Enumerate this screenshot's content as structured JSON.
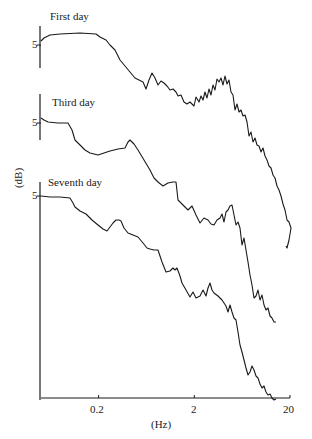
{
  "chart_data": {
    "type": "line",
    "title": "",
    "xlabel": "(Hz)",
    "ylabel": "(dB)",
    "xscale": "log",
    "xlim": [
      0.05,
      20
    ],
    "x_ticks": [
      {
        "value": 0.2,
        "label": "0.2"
      },
      {
        "value": 2,
        "label": "2"
      },
      {
        "value": 20,
        "label": "20"
      }
    ],
    "y_tick_label": "5",
    "grid": false,
    "legend_position": "none (inline labels above each trace)",
    "layout": "three vertically offset spectra sharing a log-frequency axis; each trace has its own short y-axis segment with a '5' dB tick",
    "series": [
      {
        "name": "First day",
        "offset_axis": {
          "x": 40,
          "y_top": 26,
          "y_bottom": 68,
          "tick_y": 45
        },
        "label_pos": {
          "x": 50,
          "y": 20
        },
        "points_px": [
          [
            41,
            41
          ],
          [
            44,
            38
          ],
          [
            50,
            35
          ],
          [
            60,
            34
          ],
          [
            80,
            33
          ],
          [
            96,
            34
          ],
          [
            100,
            37
          ],
          [
            106,
            40
          ],
          [
            110,
            45
          ],
          [
            115,
            50
          ],
          [
            120,
            60
          ],
          [
            125,
            66
          ],
          [
            130,
            72
          ],
          [
            135,
            78
          ],
          [
            139,
            80
          ],
          [
            143,
            82
          ],
          [
            146,
            89
          ],
          [
            149,
            80
          ],
          [
            152,
            73
          ],
          [
            155,
            78
          ],
          [
            158,
            85
          ],
          [
            161,
            81
          ],
          [
            164,
            83
          ],
          [
            167,
            86
          ],
          [
            170,
            90
          ],
          [
            173,
            89
          ],
          [
            176,
            92
          ],
          [
            178,
            96
          ],
          [
            181,
            95
          ],
          [
            184,
            102
          ],
          [
            187,
            104
          ],
          [
            190,
            102
          ],
          [
            192,
            104
          ],
          [
            194,
            106
          ],
          [
            196,
            97
          ],
          [
            199,
            102
          ],
          [
            201,
            96
          ],
          [
            203,
            100
          ],
          [
            205,
            92
          ],
          [
            207,
            98
          ],
          [
            209,
            89
          ],
          [
            211,
            95
          ],
          [
            213,
            85
          ],
          [
            215,
            90
          ],
          [
            217,
            79
          ],
          [
            219,
            82
          ],
          [
            221,
            78
          ],
          [
            223,
            85
          ],
          [
            225,
            76
          ],
          [
            227,
            84
          ],
          [
            229,
            80
          ],
          [
            231,
            92
          ],
          [
            233,
            95
          ],
          [
            235,
            110
          ],
          [
            237,
            104
          ],
          [
            239,
            112
          ],
          [
            241,
            110
          ],
          [
            243,
            116
          ],
          [
            245,
            115
          ],
          [
            247,
            122
          ],
          [
            249,
            136
          ],
          [
            251,
            132
          ],
          [
            253,
            142
          ],
          [
            255,
            138
          ],
          [
            257,
            145
          ],
          [
            259,
            146
          ],
          [
            261,
            152
          ],
          [
            263,
            148
          ],
          [
            265,
            156
          ],
          [
            267,
            160
          ],
          [
            269,
            166
          ],
          [
            271,
            168
          ],
          [
            273,
            175
          ],
          [
            275,
            178
          ],
          [
            277,
            186
          ],
          [
            279,
            190
          ],
          [
            281,
            196
          ],
          [
            283,
            204
          ],
          [
            285,
            210
          ],
          [
            287,
            220
          ],
          [
            289,
            222
          ],
          [
            291,
            228
          ],
          [
            289,
            240
          ],
          [
            287,
            248
          ],
          [
            286,
            246
          ]
        ]
      },
      {
        "name": "Third day",
        "offset_axis": {
          "x": 40,
          "y_top": 94,
          "y_bottom": 140,
          "tick_y": 123
        },
        "label_pos": {
          "x": 52,
          "y": 104
        },
        "points_px": [
          [
            41,
            118
          ],
          [
            44,
            120
          ],
          [
            48,
            122
          ],
          [
            58,
            123
          ],
          [
            68,
            123
          ],
          [
            72,
            130
          ],
          [
            75,
            140
          ],
          [
            80,
            145
          ],
          [
            85,
            150
          ],
          [
            90,
            153
          ],
          [
            98,
            155
          ],
          [
            104,
            153
          ],
          [
            110,
            151
          ],
          [
            118,
            149
          ],
          [
            125,
            148
          ],
          [
            128,
            142
          ],
          [
            130,
            140
          ],
          [
            134,
            144
          ],
          [
            138,
            150
          ],
          [
            144,
            160
          ],
          [
            150,
            170
          ],
          [
            154,
            178
          ],
          [
            158,
            182
          ],
          [
            163,
            186
          ],
          [
            168,
            183
          ],
          [
            173,
            182
          ],
          [
            176,
            182
          ],
          [
            178,
            200
          ],
          [
            183,
            205
          ],
          [
            188,
            210
          ],
          [
            192,
            206
          ],
          [
            196,
            215
          ],
          [
            200,
            223
          ],
          [
            204,
            218
          ],
          [
            208,
            220
          ],
          [
            211,
            224
          ],
          [
            214,
            225
          ],
          [
            217,
            220
          ],
          [
            220,
            218
          ],
          [
            222,
            214
          ],
          [
            224,
            222
          ],
          [
            226,
            212
          ],
          [
            228,
            210
          ],
          [
            230,
            206
          ],
          [
            232,
            205
          ],
          [
            234,
            215
          ],
          [
            236,
            225
          ],
          [
            238,
            222
          ],
          [
            240,
            228
          ],
          [
            242,
            245
          ],
          [
            244,
            238
          ],
          [
            246,
            250
          ],
          [
            248,
            262
          ],
          [
            250,
            275
          ],
          [
            252,
            285
          ],
          [
            254,
            298
          ],
          [
            256,
            296
          ],
          [
            258,
            290
          ],
          [
            260,
            300
          ],
          [
            262,
            295
          ],
          [
            264,
            305
          ],
          [
            266,
            310
          ],
          [
            268,
            308
          ],
          [
            270,
            316
          ],
          [
            272,
            318
          ],
          [
            274,
            322
          ],
          [
            276,
            322
          ]
        ]
      },
      {
        "name": "Seventh day",
        "offset_axis": {
          "x": 40,
          "y_top": 182,
          "y_bottom": 400,
          "tick_y": 196
        },
        "label_pos": {
          "x": 48,
          "y": 181
        },
        "points_px": [
          [
            41,
            196
          ],
          [
            50,
            197
          ],
          [
            60,
            197
          ],
          [
            70,
            198
          ],
          [
            73,
            203
          ],
          [
            75,
            207
          ],
          [
            80,
            211
          ],
          [
            86,
            214
          ],
          [
            90,
            218
          ],
          [
            92,
            220
          ],
          [
            98,
            225
          ],
          [
            103,
            229
          ],
          [
            107,
            231
          ],
          [
            110,
            227
          ],
          [
            113,
            223
          ],
          [
            116,
            220
          ],
          [
            119,
            220
          ],
          [
            121,
            221
          ],
          [
            124,
            228
          ],
          [
            128,
            233
          ],
          [
            133,
            235
          ],
          [
            138,
            237
          ],
          [
            143,
            243
          ],
          [
            147,
            248
          ],
          [
            150,
            249
          ],
          [
            154,
            250
          ],
          [
            158,
            250
          ],
          [
            162,
            262
          ],
          [
            166,
            272
          ],
          [
            170,
            271
          ],
          [
            173,
            268
          ],
          [
            175,
            270
          ],
          [
            177,
            268
          ],
          [
            180,
            276
          ],
          [
            182,
            283
          ],
          [
            186,
            290
          ],
          [
            190,
            297
          ],
          [
            193,
            292
          ],
          [
            196,
            298
          ],
          [
            200,
            296
          ],
          [
            203,
            290
          ],
          [
            206,
            296
          ],
          [
            208,
            288
          ],
          [
            210,
            283
          ],
          [
            212,
            290
          ],
          [
            214,
            293
          ],
          [
            218,
            296
          ],
          [
            222,
            300
          ],
          [
            226,
            306
          ],
          [
            228,
            312
          ],
          [
            230,
            305
          ],
          [
            232,
            312
          ],
          [
            234,
            318
          ],
          [
            236,
            320
          ],
          [
            238,
            332
          ],
          [
            240,
            345
          ],
          [
            242,
            352
          ],
          [
            244,
            360
          ],
          [
            246,
            368
          ],
          [
            248,
            375
          ],
          [
            250,
            372
          ],
          [
            252,
            366
          ],
          [
            254,
            370
          ],
          [
            256,
            376
          ],
          [
            258,
            378
          ],
          [
            260,
            384
          ],
          [
            262,
            388
          ],
          [
            264,
            386
          ],
          [
            266,
            392
          ],
          [
            268,
            395
          ],
          [
            270,
            394
          ],
          [
            272,
            398
          ],
          [
            274,
            400
          ],
          [
            276,
            399
          ]
        ]
      }
    ]
  },
  "axis": {
    "x_left_px": 41,
    "x_right_px": 290,
    "baseline_y_px": 398,
    "decade_px": 96
  },
  "labels": {
    "first_day": "First day",
    "third_day": "Third day",
    "seventh_day": "Seventh day",
    "y_tick": "5",
    "x_tick_0": "0.2",
    "x_tick_1": "2",
    "x_tick_2": "20",
    "xlabel": "(Hz)",
    "ylabel": "(dB)"
  },
  "colors": {
    "line": "#1a1a1a",
    "background": "#ffffff"
  }
}
